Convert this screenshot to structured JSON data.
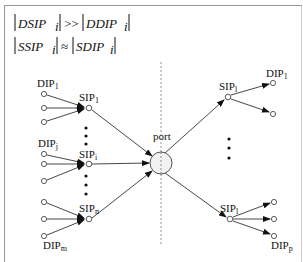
{
  "equations": {
    "line1": {
      "left": "DSIP",
      "left_sub": "i",
      "op": ">>",
      "right": "DDIP",
      "right_sub": "i"
    },
    "line2": {
      "left": "SSIP",
      "left_sub": "i",
      "op": "≈",
      "right": "SDIP",
      "right_sub": "i"
    }
  },
  "left_groups": [
    {
      "dip_label": "DIP",
      "dip_sub": "1",
      "sip_label": "SIP",
      "sip_sub": "1"
    },
    {
      "dip_label": "DIP",
      "dip_sub": "j",
      "sip_label": "SIP",
      "sip_sub": "i"
    },
    {
      "dip_label": "DIP",
      "dip_sub": "m",
      "sip_label": "SIP",
      "sip_sub": "n"
    }
  ],
  "port": {
    "label": "port"
  },
  "right_groups": [
    {
      "sip_label": "SIP",
      "sip_sub": "l",
      "dip_label": "DIP",
      "dip_sub": "1"
    },
    {
      "sip_label": "SIP",
      "sip_sub": "l",
      "dip_label": "DIP",
      "dip_sub": "p"
    }
  ],
  "colors": {
    "line": "#333333",
    "node_fill": "#ffffff",
    "port_fill": "#f2f2f2",
    "border": "#999999"
  }
}
